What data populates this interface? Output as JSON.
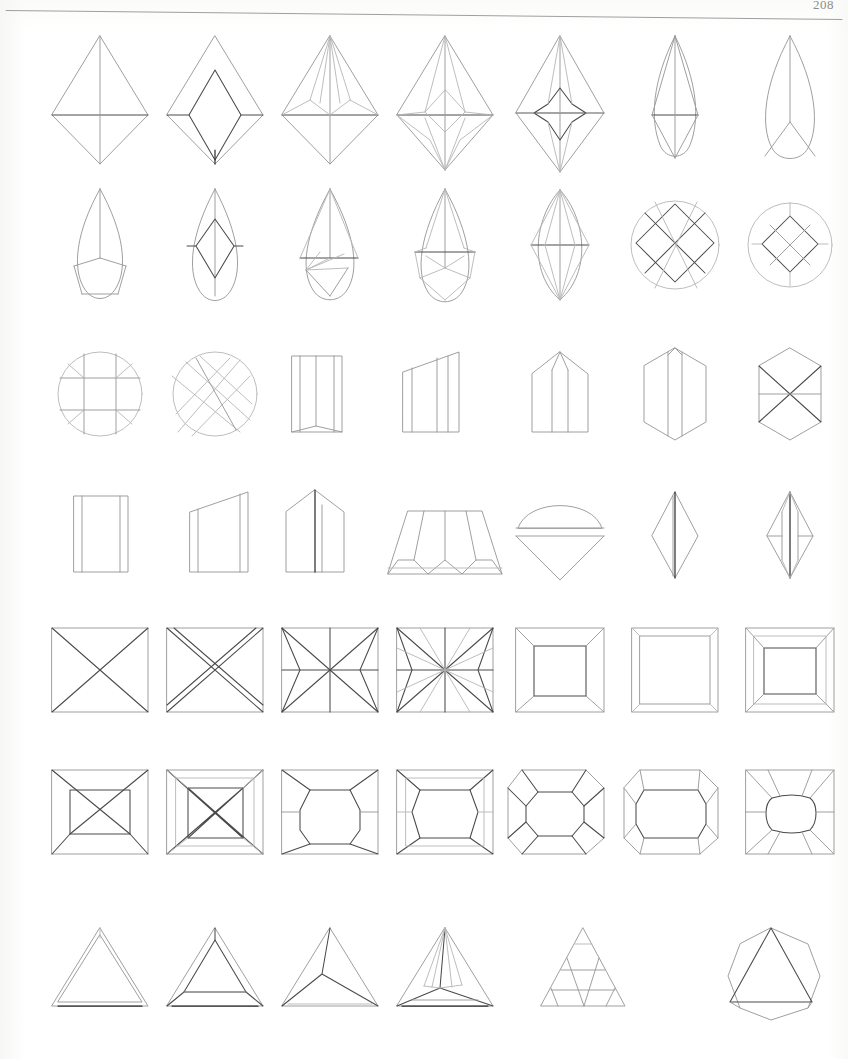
{
  "document": {
    "folio": "208",
    "page_title": "Gemstone Cut Outline Diagrams",
    "description": "Scanned book page of hand-drawn technical outlines of faceted gemstone cuts, arranged in a grid.",
    "header_rule": "horizontal-rule"
  },
  "grid": {
    "rows": 7,
    "columns": 7,
    "total_figures": 48,
    "col_x": [
      100,
      215,
      330,
      445,
      560,
      675,
      790
    ],
    "row_y": [
      100,
      245,
      395,
      535,
      670,
      812,
      975
    ],
    "last_row_columns": 6
  },
  "figures": [
    {
      "id": "r1c1",
      "row": 1,
      "col": 1,
      "name": "kite-brilliant-plain",
      "label": "Kite brilliant, plain pavilion",
      "shape": "kite",
      "facets": 4
    },
    {
      "id": "r1c2",
      "row": 1,
      "col": 2,
      "name": "kite-step-cut",
      "label": "Kite step cut with lozenge table",
      "shape": "kite",
      "facets": 8
    },
    {
      "id": "r1c3",
      "row": 1,
      "col": 3,
      "name": "kite-brilliant-split",
      "label": "Kite brilliant, split crown facets",
      "shape": "kite",
      "facets": 12
    },
    {
      "id": "r1c4",
      "row": 1,
      "col": 4,
      "name": "kite-brilliant-starred",
      "label": "Kite brilliant, star crown",
      "shape": "kite",
      "facets": 16
    },
    {
      "id": "r1c5",
      "row": 1,
      "col": 5,
      "name": "kite-brilliant-four-point-star",
      "label": "Kite brilliant, four-point star table",
      "shape": "kite",
      "facets": 20
    },
    {
      "id": "r1c6",
      "row": 1,
      "col": 6,
      "name": "pear-brilliant-simple",
      "label": "Pear cut, simple crown",
      "shape": "pear",
      "facets": 6
    },
    {
      "id": "r1c7",
      "row": 1,
      "col": 7,
      "name": "pear-outline-three-facet",
      "label": "Pear outline, three-facet base",
      "shape": "pear",
      "facets": 3
    },
    {
      "id": "r2c1",
      "row": 2,
      "col": 1,
      "name": "pear-rose-cut",
      "label": "Pear rose cut, five-facet base",
      "shape": "pear",
      "facets": 5
    },
    {
      "id": "r2c2",
      "row": 2,
      "col": 2,
      "name": "pear-step-cut-lozenge",
      "label": "Pear step cut with lozenge table",
      "shape": "pear",
      "facets": 9
    },
    {
      "id": "r2c3",
      "row": 2,
      "col": 3,
      "name": "pear-brilliant-fan",
      "label": "Pear brilliant, fanned pavilion",
      "shape": "pear",
      "facets": 11
    },
    {
      "id": "r2c4",
      "row": 2,
      "col": 4,
      "name": "pear-brilliant-star",
      "label": "Pear brilliant, star facets",
      "shape": "pear",
      "facets": 14
    },
    {
      "id": "r2c5",
      "row": 2,
      "col": 5,
      "name": "marquise-brilliant-star",
      "label": "Marquise brilliant, star table",
      "shape": "marquise",
      "facets": 16
    },
    {
      "id": "r2c6",
      "row": 2,
      "col": 6,
      "name": "round-lattice-large",
      "label": "Round cut, square lattice pattern",
      "shape": "round",
      "facets": 13
    },
    {
      "id": "r2c7",
      "row": 2,
      "col": 7,
      "name": "round-lattice-small",
      "label": "Round cut, small square lattice",
      "shape": "round",
      "facets": 9
    },
    {
      "id": "r3c1",
      "row": 3,
      "col": 1,
      "name": "round-cross-bands",
      "label": "Round cut, crossed band pattern",
      "shape": "round",
      "facets": 9
    },
    {
      "id": "r3c2",
      "row": 3,
      "col": 2,
      "name": "round-diagonal-hatch",
      "label": "Round cut, diagonal cross-hatch",
      "shape": "round",
      "facets": 24
    },
    {
      "id": "r3c3",
      "row": 3,
      "col": 3,
      "name": "rectangle-beveled-upright",
      "label": "Rectangular bevel cut, upright",
      "shape": "rectangle",
      "facets": 5
    },
    {
      "id": "r3c4",
      "row": 3,
      "col": 4,
      "name": "trapezoid-right-angled",
      "label": "Right-angled trapezoid cut",
      "shape": "trapezoid",
      "facets": 5
    },
    {
      "id": "r3c5",
      "row": 3,
      "col": 5,
      "name": "pentagon-house-cut",
      "label": "Pentagonal house-form cut",
      "shape": "pentagon",
      "facets": 6
    },
    {
      "id": "r3c6",
      "row": 3,
      "col": 6,
      "name": "hexagon-vertical-ridge",
      "label": "Hexagon cut, vertical ridge",
      "shape": "hexagon",
      "facets": 6
    },
    {
      "id": "r3c7",
      "row": 3,
      "col": 7,
      "name": "hexagon-six-triangle",
      "label": "Hexagon cut, six triangular facets",
      "shape": "hexagon",
      "facets": 6
    },
    {
      "id": "r4c1",
      "row": 4,
      "col": 1,
      "name": "rectangle-plain-bevel",
      "label": "Plain rectangle with bevel edges",
      "shape": "rectangle",
      "facets": 3
    },
    {
      "id": "r4c2",
      "row": 4,
      "col": 2,
      "name": "trapezoid-sloped-top",
      "label": "Trapezoid with sloped top",
      "shape": "trapezoid",
      "facets": 3
    },
    {
      "id": "r4c3",
      "row": 4,
      "col": 3,
      "name": "pentagon-gable-cut",
      "label": "Pentagonal gable cut",
      "shape": "pentagon",
      "facets": 4
    },
    {
      "id": "r4c4",
      "row": 4,
      "col": 4,
      "name": "trapezoid-scalloped-base",
      "label": "Wide trapezoid, scalloped base",
      "shape": "trapezoid",
      "facets": 12
    },
    {
      "id": "r4c5",
      "row": 4,
      "col": 5,
      "name": "half-round-cone",
      "label": "Half-round crown with cone pavilion",
      "shape": "half-round",
      "facets": 5
    },
    {
      "id": "r4c6",
      "row": 4,
      "col": 6,
      "name": "narrow-kite-plain",
      "label": "Narrow kite, plain",
      "shape": "kite",
      "facets": 4
    },
    {
      "id": "r4c7",
      "row": 4,
      "col": 7,
      "name": "narrow-kite-faceted",
      "label": "Narrow kite, multi-faceted",
      "shape": "kite",
      "facets": 10
    },
    {
      "id": "r5c1",
      "row": 5,
      "col": 1,
      "name": "square-x-diagonals",
      "label": "Square cut, crossed diagonals",
      "shape": "square",
      "facets": 4
    },
    {
      "id": "r5c2",
      "row": 5,
      "col": 2,
      "name": "square-double-x",
      "label": "Square cut, doubled diagonals",
      "shape": "square",
      "facets": 8
    },
    {
      "id": "r5c3",
      "row": 5,
      "col": 3,
      "name": "square-four-point-star",
      "label": "Square cut, four-point star",
      "shape": "square",
      "facets": 12
    },
    {
      "id": "r5c4",
      "row": 5,
      "col": 4,
      "name": "square-eight-point-star",
      "label": "Square cut, eight-point star",
      "shape": "square",
      "facets": 16
    },
    {
      "id": "r5c5",
      "row": 5,
      "col": 5,
      "name": "square-step-cut",
      "label": "Square step cut, single step",
      "shape": "square",
      "facets": 5
    },
    {
      "id": "r5c6",
      "row": 5,
      "col": 6,
      "name": "square-shallow-step",
      "label": "Square shallow step cut",
      "shape": "square",
      "facets": 5
    },
    {
      "id": "r5c7",
      "row": 5,
      "col": 7,
      "name": "square-step-cut-deep",
      "label": "Square step cut, deep table",
      "shape": "square",
      "facets": 5
    },
    {
      "id": "r6c1",
      "row": 6,
      "col": 1,
      "name": "square-inner-square-x",
      "label": "Square with inner square and X",
      "shape": "square",
      "facets": 8
    },
    {
      "id": "r6c2",
      "row": 6,
      "col": 2,
      "name": "princess-cut-crossed",
      "label": "Princess cut, crossed corners",
      "shape": "square",
      "facets": 16
    },
    {
      "id": "r6c3",
      "row": 6,
      "col": 3,
      "name": "square-octagon-table",
      "label": "Square with octagonal table",
      "shape": "square",
      "facets": 12
    },
    {
      "id": "r6c4",
      "row": 6,
      "col": 4,
      "name": "princess-cut-double",
      "label": "Princess cut, doubled facets",
      "shape": "square",
      "facets": 20
    },
    {
      "id": "r6c5",
      "row": 6,
      "col": 5,
      "name": "cushion-octagon-table",
      "label": "Cushion cut, octagon table",
      "shape": "cushion",
      "facets": 12
    },
    {
      "id": "r6c6",
      "row": 6,
      "col": 6,
      "name": "cushion-step-cut",
      "label": "Cushion step cut",
      "shape": "cushion",
      "facets": 8
    },
    {
      "id": "r6c7",
      "row": 6,
      "col": 7,
      "name": "square-radiating-oval",
      "label": "Square with radiating oval table",
      "shape": "square",
      "facets": 14
    },
    {
      "id": "r7c1",
      "row": 7,
      "col": 1,
      "name": "triangle-plain-bevel",
      "label": "Triangular cut, plain bevel",
      "shape": "triangle",
      "facets": 3
    },
    {
      "id": "r7c2",
      "row": 7,
      "col": 2,
      "name": "trilliant-three-facet",
      "label": "Trilliant cut, three crown facets",
      "shape": "triangle",
      "facets": 6
    },
    {
      "id": "r7c3",
      "row": 7,
      "col": 3,
      "name": "triangle-y-facets",
      "label": "Triangular cut, Y facet split",
      "shape": "triangle",
      "facets": 4
    },
    {
      "id": "r7c4",
      "row": 7,
      "col": 4,
      "name": "trilliant-fan-facets",
      "label": "Trilliant cut, fanned facets",
      "shape": "triangle",
      "facets": 10
    },
    {
      "id": "r7c5",
      "row": 7,
      "col": 5,
      "name": "triangle-lattice-hatch",
      "label": "Triangular cut, lattice hatch",
      "shape": "triangle",
      "facets": 20
    },
    {
      "id": "r7c6",
      "row": 7,
      "col": 6,
      "name": "octagon-triangle-table",
      "label": "Octagonal outline, triangular table",
      "shape": "octagon",
      "facets": 7
    }
  ]
}
